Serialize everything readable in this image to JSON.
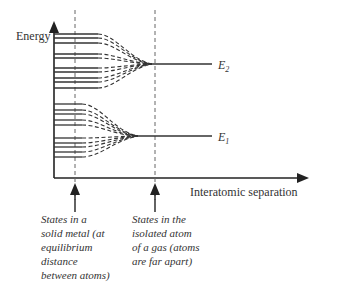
{
  "diagram": {
    "y_axis_label": "Energy",
    "x_axis_label": "Interatomic separation",
    "levels": [
      {
        "name": "E2",
        "label_main": "E",
        "label_sub": "2"
      },
      {
        "name": "E1",
        "label_main": "E",
        "label_sub": "1"
      }
    ],
    "captions": {
      "solid": "States in a\nsolid metal (at\nequilibrium\ndistance\nbetween atoms)",
      "gas": "States in the\nisolated atom\nof a gas (atoms\nare far apart)"
    },
    "upper_band_line_count": 10,
    "lower_band_line_count": 10,
    "colors": {
      "ink": "#333333",
      "dash": "#555555"
    }
  }
}
